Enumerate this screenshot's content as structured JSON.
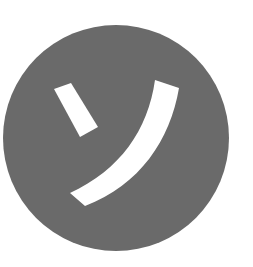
{
  "icon": {
    "name": "katakana-so-badge",
    "character": "ソ",
    "reading": "so",
    "background_color": "#6a6a6a",
    "glyph_color": "#ffffff",
    "page_background": "#ffffff"
  }
}
